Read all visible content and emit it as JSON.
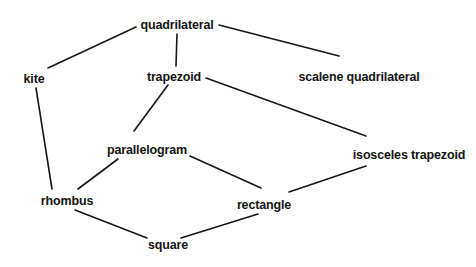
{
  "diagram": {
    "type": "node-link-diagram",
    "canvas": {
      "width": 476,
      "height": 267
    },
    "style": {
      "background_color": "#ffffff",
      "text_color": "#141414",
      "edge_color": "#171717",
      "edge_width": 1.6
    },
    "nodes": [
      {
        "id": "quadrilateral",
        "label": "quadrilateral",
        "x": 177,
        "y": 25
      },
      {
        "id": "kite",
        "label": "kite",
        "x": 34,
        "y": 79
      },
      {
        "id": "trapezoid",
        "label": "trapezoid",
        "x": 174,
        "y": 77
      },
      {
        "id": "scalene_quadrilateral",
        "label": "scalene quadrilateral",
        "x": 359,
        "y": 77
      },
      {
        "id": "parallelogram",
        "label": "parallelogram",
        "x": 147,
        "y": 150
      },
      {
        "id": "isosceles_trapezoid",
        "label": "isosceles trapezoid",
        "x": 409,
        "y": 155
      },
      {
        "id": "rhombus",
        "label": "rhombus",
        "x": 67,
        "y": 201
      },
      {
        "id": "rectangle",
        "label": "rectangle",
        "x": 264,
        "y": 205
      },
      {
        "id": "square",
        "label": "square",
        "x": 168,
        "y": 245
      }
    ],
    "edges": [
      {
        "id": "e-quad-kite",
        "from": "quadrilateral",
        "to": "kite",
        "x1": 136,
        "y1": 27,
        "x2": 48,
        "y2": 68
      },
      {
        "id": "e-quad-trap",
        "from": "quadrilateral",
        "to": "trapezoid",
        "x1": 177,
        "y1": 34,
        "x2": 176,
        "y2": 66
      },
      {
        "id": "e-quad-scalene",
        "from": "quadrilateral",
        "to": "scalene_quadrilateral",
        "x1": 219,
        "y1": 25,
        "x2": 339,
        "y2": 56
      },
      {
        "id": "e-trap-para",
        "from": "trapezoid",
        "to": "parallelogram",
        "x1": 168,
        "y1": 85,
        "x2": 134,
        "y2": 131
      },
      {
        "id": "e-trap-isos",
        "from": "trapezoid",
        "to": "isosceles_trapezoid",
        "x1": 206,
        "y1": 78,
        "x2": 366,
        "y2": 136
      },
      {
        "id": "e-kite-rhombus",
        "from": "kite",
        "to": "rhombus",
        "x1": 36,
        "y1": 88,
        "x2": 52,
        "y2": 189
      },
      {
        "id": "e-para-rhombus",
        "from": "parallelogram",
        "to": "rhombus",
        "x1": 118,
        "y1": 159,
        "x2": 78,
        "y2": 189
      },
      {
        "id": "e-para-rect",
        "from": "parallelogram",
        "to": "rectangle",
        "x1": 190,
        "y1": 156,
        "x2": 261,
        "y2": 188
      },
      {
        "id": "e-isos-rect",
        "from": "isosceles_trapezoid",
        "to": "rectangle",
        "x1": 366,
        "y1": 166,
        "x2": 289,
        "y2": 192
      },
      {
        "id": "e-rhombus-square",
        "from": "rhombus",
        "to": "square",
        "x1": 75,
        "y1": 210,
        "x2": 147,
        "y2": 238
      },
      {
        "id": "e-rect-square",
        "from": "rectangle",
        "to": "square",
        "x1": 258,
        "y1": 214,
        "x2": 181,
        "y2": 238
      }
    ]
  }
}
